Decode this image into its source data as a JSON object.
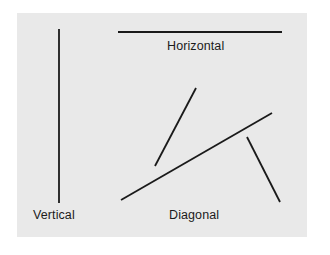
{
  "figure": {
    "background_color": "#ffffff",
    "panel_color": "#e9e9e9",
    "line_color": "#1a1a1a",
    "panel": {
      "x": 17,
      "y": 13,
      "width": 290,
      "height": 224
    }
  },
  "labels": {
    "vertical": "Vertical",
    "horizontal": "Horizontal",
    "diagonal": "Diagonal"
  },
  "chart_data": {
    "type": "scatter",
    "title": "",
    "xlabel": "",
    "ylabel": "",
    "xlim": [
      17,
      307
    ],
    "ylim": [
      13,
      237
    ],
    "grid": false,
    "legend": "none",
    "annotations": [
      {
        "text": "Horizontal",
        "x": 205,
        "y": 46
      },
      {
        "text": "Vertical",
        "x": 56,
        "y": 215
      },
      {
        "text": "Diagonal",
        "x": 196,
        "y": 215
      }
    ],
    "series": [
      {
        "name": "vertical-line",
        "orientation": "vertical",
        "x1": 59,
        "y1": 29,
        "x2": 59,
        "y2": 203,
        "angle_deg": 90,
        "length_px": 174,
        "stroke": "#1a1a1a",
        "stroke_width": 1.8
      },
      {
        "name": "horizontal-line",
        "orientation": "horizontal",
        "x1": 118,
        "y1": 32,
        "x2": 282,
        "y2": 32,
        "angle_deg": 0,
        "length_px": 164,
        "stroke": "#1a1a1a",
        "stroke_width": 1.8
      },
      {
        "name": "diagonal-line-steep",
        "orientation": "diagonal",
        "x1": 155,
        "y1": 166,
        "x2": 196,
        "y2": 88,
        "angle_deg": 62,
        "length_px": 88,
        "stroke": "#1a1a1a",
        "stroke_width": 1.8
      },
      {
        "name": "diagonal-line-long",
        "orientation": "diagonal",
        "x1": 121,
        "y1": 200,
        "x2": 272,
        "y2": 113,
        "angle_deg": 30,
        "length_px": 174,
        "stroke": "#1a1a1a",
        "stroke_width": 1.8
      },
      {
        "name": "diagonal-line-descending",
        "orientation": "diagonal",
        "x1": 247,
        "y1": 137,
        "x2": 280,
        "y2": 202,
        "angle_deg": -63,
        "length_px": 73,
        "stroke": "#1a1a1a",
        "stroke_width": 1.8
      }
    ]
  }
}
